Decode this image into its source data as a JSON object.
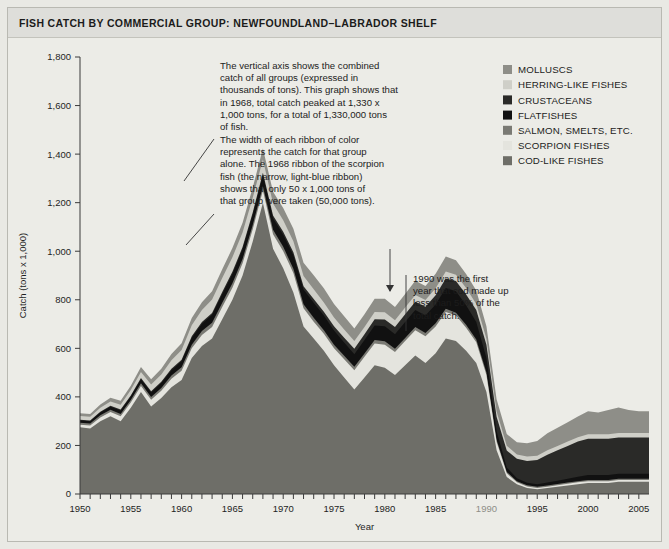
{
  "header": {
    "title": "FISH CATCH BY COMMERCIAL GROUP: NEWFOUNDLAND–LABRADOR SHELF"
  },
  "legend": {
    "position": "top-right",
    "items": [
      {
        "label": "MOLLUSCS",
        "color": "#8e8e88"
      },
      {
        "label": "HERRING-LIKE FISHES",
        "color": "#cfcfc8"
      },
      {
        "label": "CRUSTACEANS",
        "color": "#2a2a28"
      },
      {
        "label": "FLATFISHES",
        "color": "#111111"
      },
      {
        "label": "SALMON, SMELTS, ETC.",
        "color": "#7a7a74"
      },
      {
        "label": "SCORPION FISHES",
        "color": "#e4e4de"
      },
      {
        "label": "COD-LIKE FISHES",
        "color": "#6e6e68"
      }
    ]
  },
  "annotations": [
    {
      "name": "peak-annotation",
      "lines": [
        "The vertical axis shows the combined",
        "catch of all groups (expressed in",
        "thousands of tons). This graph shows that",
        "in 1968, total catch peaked at 1,330 x",
        "1,000 tons, for a total of 1,330,000 tons",
        "of fish."
      ]
    },
    {
      "name": "ribbon-annotation",
      "lines": [
        "The width of each ribbon of color",
        "represents the catch for that group",
        "alone. The 1968 ribbon of the scorpion",
        "fish (the narrow, light-blue ribbon)",
        "shows that only 50 x 1,000 tons of",
        "that group were taken (50,000 tons)."
      ]
    },
    {
      "name": "cod-1990-annotation",
      "lines": [
        "1990 was the first",
        "year that cod made up",
        "less than 50% of the",
        "total catch."
      ]
    }
  ],
  "chart_data": {
    "type": "area",
    "stacked": true,
    "title": "FISH CATCH BY COMMERCIAL GROUP: NEWFOUNDLAND–LABRADOR SHELF",
    "xlabel": "Year",
    "ylabel": "Catch (tons x 1,000)",
    "xlim": [
      1950,
      2006
    ],
    "ylim": [
      0,
      1800
    ],
    "yticks": [
      0,
      200,
      400,
      600,
      800,
      1000,
      1200,
      1400,
      1600,
      1800
    ],
    "ytick_labels": [
      "0",
      "200",
      "400",
      "600",
      "800",
      "1,000",
      "1,200",
      "1,400",
      "1,600",
      "1,800"
    ],
    "xticks_labeled": [
      1950,
      1955,
      1960,
      1965,
      1970,
      1975,
      1980,
      1985,
      1990,
      1995,
      2000,
      2005
    ],
    "xtick_interval": 1,
    "grid": false,
    "x": [
      1950,
      1951,
      1952,
      1953,
      1954,
      1955,
      1956,
      1957,
      1958,
      1959,
      1960,
      1961,
      1962,
      1963,
      1964,
      1965,
      1966,
      1967,
      1968,
      1969,
      1970,
      1971,
      1972,
      1973,
      1974,
      1975,
      1976,
      1977,
      1978,
      1979,
      1980,
      1981,
      1982,
      1983,
      1984,
      1985,
      1986,
      1987,
      1988,
      1989,
      1990,
      1991,
      1992,
      1993,
      1994,
      1995,
      1996,
      1997,
      1998,
      1999,
      2000,
      2001,
      2002,
      2003,
      2004,
      2005,
      2006
    ],
    "series": [
      {
        "name": "COD-LIKE FISHES",
        "color": "#6e6e68",
        "values": [
          275,
          270,
          300,
          320,
          300,
          355,
          420,
          360,
          395,
          440,
          470,
          560,
          610,
          640,
          720,
          800,
          900,
          1040,
          1200,
          1010,
          930,
          830,
          690,
          640,
          590,
          530,
          480,
          430,
          480,
          530,
          520,
          490,
          530,
          570,
          540,
          580,
          640,
          630,
          590,
          540,
          420,
          180,
          70,
          40,
          25,
          20,
          25,
          30,
          35,
          40,
          45,
          45,
          45,
          50,
          50,
          50,
          50
        ]
      },
      {
        "name": "SCORPION FISHES",
        "color": "#e4e4de",
        "values": [
          10,
          12,
          15,
          18,
          20,
          22,
          25,
          28,
          30,
          35,
          38,
          40,
          45,
          48,
          50,
          50,
          50,
          50,
          50,
          60,
          70,
          80,
          75,
          70,
          70,
          70,
          75,
          80,
          85,
          90,
          95,
          95,
          100,
          105,
          110,
          110,
          110,
          105,
          95,
          85,
          70,
          35,
          15,
          8,
          6,
          5,
          5,
          6,
          7,
          8,
          8,
          8,
          8,
          8,
          8,
          8,
          8
        ]
      },
      {
        "name": "SALMON, SMELTS, ETC.",
        "color": "#7a7a74",
        "values": [
          8,
          8,
          9,
          9,
          10,
          10,
          11,
          12,
          12,
          13,
          14,
          15,
          16,
          17,
          18,
          18,
          18,
          18,
          18,
          18,
          18,
          18,
          17,
          16,
          15,
          15,
          14,
          14,
          14,
          14,
          14,
          13,
          13,
          13,
          13,
          13,
          13,
          12,
          12,
          11,
          10,
          8,
          6,
          5,
          5,
          5,
          5,
          5,
          5,
          5,
          5,
          5,
          5,
          5,
          5,
          5,
          5
        ]
      },
      {
        "name": "FLATFISHES",
        "color": "#111111",
        "values": [
          10,
          10,
          12,
          12,
          14,
          15,
          17,
          18,
          20,
          22,
          25,
          28,
          30,
          33,
          36,
          38,
          40,
          42,
          45,
          48,
          50,
          55,
          60,
          62,
          60,
          58,
          55,
          52,
          55,
          60,
          62,
          60,
          65,
          70,
          72,
          78,
          85,
          88,
          80,
          72,
          60,
          35,
          18,
          12,
          10,
          10,
          12,
          14,
          16,
          18,
          20,
          20,
          20,
          20,
          20,
          20,
          20
        ]
      },
      {
        "name": "CRUSTACEANS",
        "color": "#2a2a28",
        "values": [
          3,
          3,
          3,
          4,
          4,
          4,
          5,
          5,
          5,
          6,
          6,
          7,
          7,
          8,
          8,
          9,
          9,
          10,
          10,
          11,
          12,
          13,
          14,
          15,
          16,
          18,
          20,
          22,
          24,
          26,
          28,
          30,
          32,
          34,
          36,
          38,
          40,
          42,
          45,
          50,
          55,
          60,
          70,
          80,
          90,
          100,
          115,
          125,
          135,
          145,
          150,
          150,
          150,
          150,
          150,
          150,
          150
        ]
      },
      {
        "name": "HERRING-LIKE FISHES",
        "color": "#cfcfc8",
        "values": [
          15,
          15,
          16,
          18,
          20,
          22,
          25,
          28,
          30,
          35,
          40,
          45,
          50,
          55,
          58,
          60,
          60,
          60,
          55,
          50,
          48,
          45,
          42,
          40,
          38,
          36,
          34,
          32,
          30,
          30,
          30,
          28,
          28,
          28,
          28,
          28,
          28,
          26,
          26,
          25,
          24,
          22,
          20,
          18,
          18,
          18,
          18,
          18,
          18,
          18,
          18,
          18,
          18,
          18,
          18,
          18,
          18
        ]
      },
      {
        "name": "MOLLUSCS",
        "color": "#8e8e88",
        "values": [
          12,
          12,
          14,
          15,
          16,
          18,
          20,
          22,
          24,
          26,
          28,
          30,
          32,
          34,
          36,
          38,
          40,
          42,
          45,
          48,
          50,
          52,
          55,
          58,
          58,
          56,
          54,
          52,
          52,
          54,
          55,
          54,
          56,
          58,
          58,
          60,
          62,
          60,
          58,
          55,
          52,
          50,
          48,
          50,
          55,
          60,
          70,
          75,
          80,
          85,
          95,
          90,
          100,
          105,
          95,
          90,
          90
        ]
      }
    ]
  }
}
